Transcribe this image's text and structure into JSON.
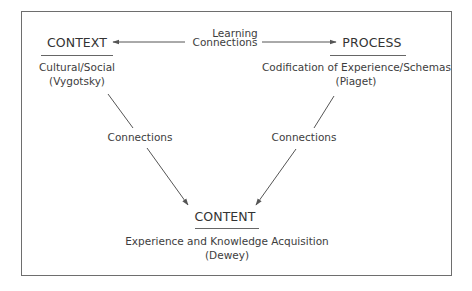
{
  "diagram": {
    "center_label": {
      "line1": "Learning",
      "line2": "Connections"
    },
    "nodes": {
      "context": {
        "title": "CONTEXT",
        "line1": "Cultural/Social",
        "line2": "(Vygotsky)"
      },
      "process": {
        "title": "PROCESS",
        "line1": "Codification of Experience/Schemas",
        "line2": "(Piaget)"
      },
      "content": {
        "title": "CONTENT",
        "line1": "Experience and Knowledge Acquisition",
        "line2": "(Dewey)"
      }
    },
    "edges": [
      {
        "from": "learning-connections",
        "to": "context",
        "label": ""
      },
      {
        "from": "learning-connections",
        "to": "process",
        "label": ""
      },
      {
        "from": "context",
        "to": "content",
        "label": "Connections"
      },
      {
        "from": "process",
        "to": "content",
        "label": "Connections"
      }
    ],
    "colors": {
      "line": "#555555",
      "text": "#3a3a3a",
      "border": "#6e6e6e"
    }
  }
}
